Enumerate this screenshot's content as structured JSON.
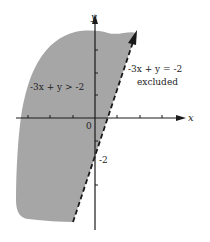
{
  "graph": {
    "axis_x_label": "x",
    "axis_y_label": "y",
    "origin_label": "0",
    "y_intercept_label": "-2",
    "region_label": "-3x + y > -2",
    "boundary_label": "-3x + y = -2",
    "boundary_note": "excluded",
    "shade_color": "#a6a6a6",
    "line_color": "#1a1a1a"
  }
}
